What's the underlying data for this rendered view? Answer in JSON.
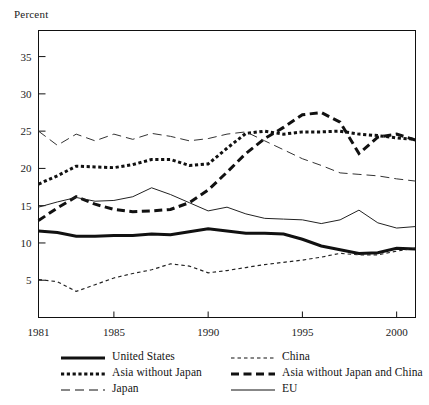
{
  "figure": {
    "ylabel": "Percent",
    "background": "#ffffff",
    "ink_color": "#111111"
  },
  "chart_data": {
    "type": "line",
    "title": "",
    "subtitle": "",
    "xlabel": "",
    "ylabel": "Percent",
    "xlim": [
      1981,
      2001
    ],
    "ylim": [
      0,
      38.5
    ],
    "yticks": [
      5,
      10,
      15,
      20,
      25,
      30,
      35
    ],
    "ytick_labels": [
      "5",
      "10",
      "15",
      "20",
      "25",
      "30",
      "35"
    ],
    "xticks": [
      1981,
      1985,
      1990,
      1995,
      2000
    ],
    "xtick_labels": [
      "1981",
      "1985",
      "1990",
      "1995",
      "2000"
    ],
    "grid": false,
    "legend_position": "below-axes",
    "x": [
      1981,
      1982,
      1983,
      1984,
      1985,
      1986,
      1987,
      1988,
      1989,
      1990,
      1991,
      1992,
      1993,
      1994,
      1995,
      1996,
      1997,
      1998,
      1999,
      2000,
      2001
    ],
    "series": [
      {
        "name": "United States",
        "style": "solid-thick",
        "color": "#111111",
        "values": [
          11.6,
          11.4,
          10.9,
          10.9,
          11.0,
          11.0,
          11.2,
          11.1,
          11.5,
          11.9,
          11.6,
          11.3,
          11.3,
          11.2,
          10.5,
          9.6,
          9.1,
          8.6,
          8.7,
          9.3,
          9.2
        ]
      },
      {
        "name": "China",
        "style": "dotted-fine",
        "color": "#222222",
        "values": [
          5.1,
          4.8,
          3.5,
          4.4,
          5.3,
          5.9,
          6.4,
          7.2,
          6.9,
          6.0,
          6.3,
          6.7,
          7.1,
          7.4,
          7.7,
          8.1,
          8.6,
          8.4,
          8.4,
          8.9,
          9.3
        ]
      },
      {
        "name": "Asia without Japan",
        "style": "dotted-thick",
        "color": "#111111",
        "values": [
          17.9,
          19.0,
          20.3,
          20.2,
          20.1,
          20.5,
          21.2,
          21.2,
          20.4,
          20.6,
          22.7,
          24.7,
          25.0,
          24.6,
          24.9,
          24.9,
          25.0,
          24.6,
          24.4,
          24.1,
          23.9
        ]
      },
      {
        "name": "Asia without Japan and China",
        "style": "dashed-thick",
        "color": "#111111",
        "values": [
          13.0,
          14.7,
          16.2,
          15.2,
          14.5,
          14.2,
          14.3,
          14.5,
          15.4,
          17.1,
          19.5,
          22.0,
          24.0,
          25.5,
          27.2,
          27.5,
          26.2,
          22.0,
          24.2,
          24.6,
          23.8
        ]
      },
      {
        "name": "Japan",
        "style": "dashed-thin",
        "color": "#333333",
        "values": [
          25.0,
          23.1,
          24.6,
          23.7,
          24.6,
          23.9,
          24.7,
          24.3,
          23.7,
          24.0,
          24.6,
          24.9,
          23.7,
          22.5,
          21.3,
          20.4,
          19.4,
          19.2,
          19.0,
          18.6,
          18.3
        ]
      },
      {
        "name": "EU",
        "style": "solid-thin",
        "color": "#222222",
        "values": [
          14.8,
          15.5,
          16.1,
          15.6,
          15.7,
          16.2,
          17.4,
          16.5,
          15.4,
          14.3,
          14.8,
          13.9,
          13.3,
          13.2,
          13.1,
          12.6,
          13.1,
          14.4,
          12.7,
          12.0,
          12.2
        ]
      }
    ]
  },
  "legend": {
    "rows": [
      [
        {
          "label": "United States",
          "style": "solid-thick"
        },
        {
          "label": "China",
          "style": "dotted-fine"
        }
      ],
      [
        {
          "label": "Asia without Japan",
          "style": "dotted-thick"
        },
        {
          "label": "Asia without Japan and China",
          "style": "dashed-thick"
        }
      ],
      [
        {
          "label": "Japan",
          "style": "dashed-thin"
        },
        {
          "label": "EU",
          "style": "solid-thin"
        }
      ]
    ]
  }
}
